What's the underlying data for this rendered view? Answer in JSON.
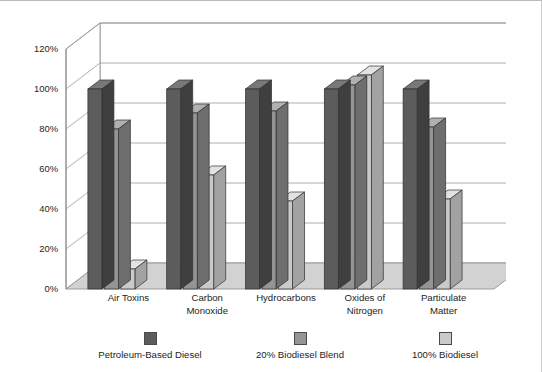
{
  "chart_data": {
    "type": "bar",
    "title": "",
    "subtitle": "",
    "xlabel": "",
    "ylabel": "Percentage of Emission Compared to Petroleum-Based Diesel",
    "ylim": [
      0,
      120
    ],
    "y_tick_step": 20,
    "y_tick_labels": [
      "0%",
      "20%",
      "40%",
      "60%",
      "80%",
      "100%",
      "120%"
    ],
    "y_tick_values": [
      0,
      20,
      40,
      60,
      80,
      100,
      120
    ],
    "grid": true,
    "grid_axis": "y",
    "legend_position": "bottom",
    "three_d": true,
    "categories": [
      "Air Toxins",
      "Carbon Monoxide",
      "Hydrocarbons",
      "Oxides of Nitrogen",
      "Particulate Matter"
    ],
    "category_lines": [
      [
        "Air Toxins"
      ],
      [
        "Carbon",
        "Monoxide"
      ],
      [
        "Hydrocarbons"
      ],
      [
        "Oxides of",
        "Nitrogen"
      ],
      [
        "Particulate",
        "Matter"
      ]
    ],
    "series": [
      {
        "name": "Petroleum-Based Diesel",
        "color": "#5c5c5c",
        "side_color": "#3f3f3f",
        "top_color": "#787878",
        "values": [
          100,
          100,
          100,
          100,
          100
        ]
      },
      {
        "name": "20% Biodiesel Blend",
        "color": "#949494",
        "side_color": "#6e6e6e",
        "top_color": "#b0b0b0",
        "values": [
          80,
          88,
          89,
          102,
          81
        ]
      },
      {
        "name": "100% Biodiesel",
        "color": "#cacaca",
        "side_color": "#a2a2a2",
        "top_color": "#e2e2e2",
        "values": [
          10,
          57,
          44,
          107,
          45
        ]
      }
    ]
  },
  "legend": {
    "items": [
      {
        "label": "Petroleum-Based Diesel",
        "color": "#5c5c5c"
      },
      {
        "label": "20% Biodiesel Blend",
        "color": "#949494"
      },
      {
        "label": "100% Biodiesel",
        "color": "#cacaca"
      }
    ]
  },
  "colors": {
    "background": "#ffffff",
    "floor": "#d2d2d2",
    "wall": "#ffffff",
    "axis_line": "#8a8a8a",
    "grid_line": "#9a9a9a",
    "text": "#1d1d1d"
  }
}
